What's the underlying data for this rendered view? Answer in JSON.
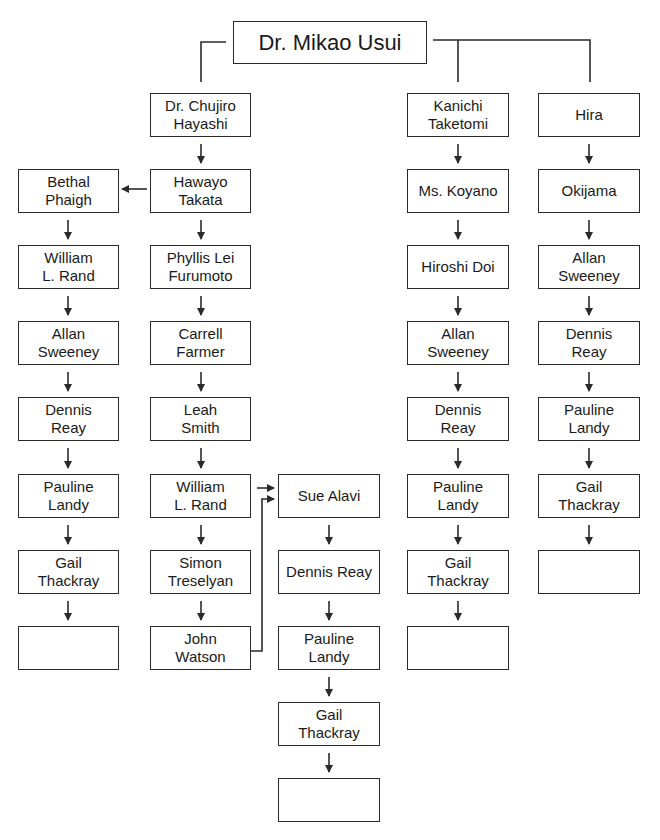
{
  "root": {
    "label": "Dr. Mikao Usui"
  },
  "lineages": [
    {
      "name": "hayashi-takata-phaigh",
      "nodes": [
        "Bethal\nPhaigh",
        "William\nL. Rand",
        "Allan\nSweeney",
        "Dennis\nReay",
        "Pauline\nLandy",
        "Gail\nThackray",
        ""
      ]
    },
    {
      "name": "hayashi-takata-furumoto",
      "nodes": [
        "Dr. Chujiro\nHayashi",
        "Hawayo\nTakata",
        "Phyllis Lei\nFurumoto",
        "Carrell\nFarmer",
        "Leah\nSmith",
        "William\nL. Rand",
        "Simon\nTreselyan",
        "John\nWatson"
      ]
    },
    {
      "name": "alavi-branch",
      "nodes": [
        "Sue Alavi",
        "Dennis Reay",
        "Pauline\nLandy",
        "Gail\nThackray",
        ""
      ]
    },
    {
      "name": "taketomi",
      "nodes": [
        "Kanichi\nTaketomi",
        "Ms. Koyano",
        "Hiroshi Doi",
        "Allan\nSweeney",
        "Dennis\nReay",
        "Pauline\nLandy",
        "Gail\nThackray",
        ""
      ]
    },
    {
      "name": "hira",
      "nodes": [
        "Hira",
        "Okijama",
        "Allan\nSweeney",
        "Dennis\nReay",
        "Pauline\nLandy",
        "Gail\nThackray",
        ""
      ]
    }
  ],
  "colors": {
    "line": "#2a2a2a",
    "box_border": "#2a2a2a",
    "background": "#ffffff"
  }
}
